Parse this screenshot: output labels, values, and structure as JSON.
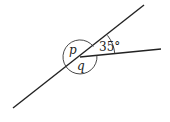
{
  "diagram": {
    "labels": {
      "p": "p",
      "q": "q",
      "angle": "35°"
    },
    "colors": {
      "stroke": "#222222",
      "background": "#ffffff"
    }
  }
}
